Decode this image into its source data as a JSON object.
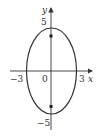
{
  "figure": {
    "type": "ellipse",
    "equation_params": {
      "a": 3,
      "b": 5,
      "center": [
        0,
        0
      ]
    },
    "foci_marked": 2,
    "colors": {
      "stroke": "#333333",
      "background": "#ffffff"
    }
  },
  "axes": {
    "x_label": "x",
    "y_label": "y",
    "origin_label": "0"
  },
  "ticks": {
    "x_neg": "−3",
    "x_pos": "3",
    "y_pos": "5",
    "y_neg": "−5"
  }
}
